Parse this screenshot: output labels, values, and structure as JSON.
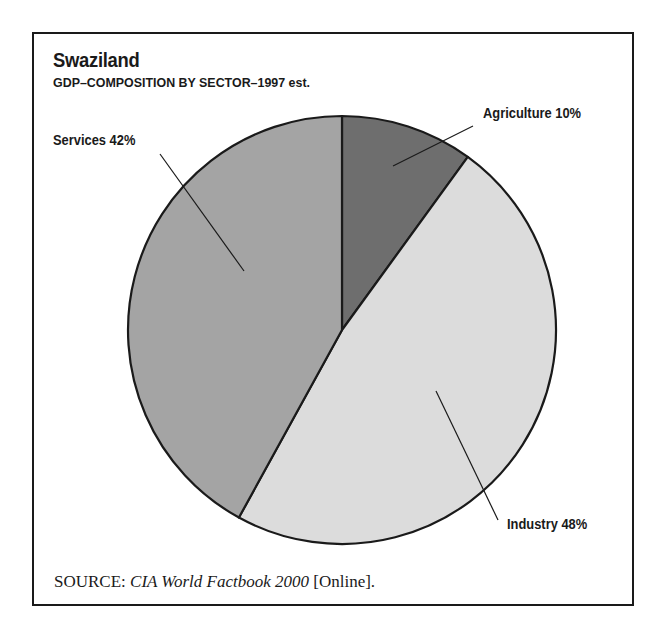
{
  "title": "Swaziland",
  "subtitle": "GDP–COMPOSITION BY SECTOR–1997 est.",
  "labels": {
    "agriculture": "Agriculture 10%",
    "services": "Services 42%",
    "industry": "Industry 48%"
  },
  "source": {
    "prefix": "SOURCE:",
    "title": "CIA World Factbook 2000",
    "suffix": "[Online]."
  },
  "colors": {
    "agriculture": "#6e6e6e",
    "industry": "#dcdcdc",
    "services": "#a4a4a4",
    "outline": "#1a1a1a"
  },
  "chart_data": {
    "type": "pie",
    "title": "Swaziland",
    "subtitle": "GDP–COMPOSITION BY SECTOR–1997 est.",
    "categories": [
      "Agriculture",
      "Industry",
      "Services"
    ],
    "values": [
      10,
      48,
      42
    ],
    "unit": "%",
    "start_angle": "12 o'clock, clockwise",
    "legend": "none (direct labels with leader lines)",
    "source": "SOURCE: CIA World Factbook 2000 [Online]."
  }
}
